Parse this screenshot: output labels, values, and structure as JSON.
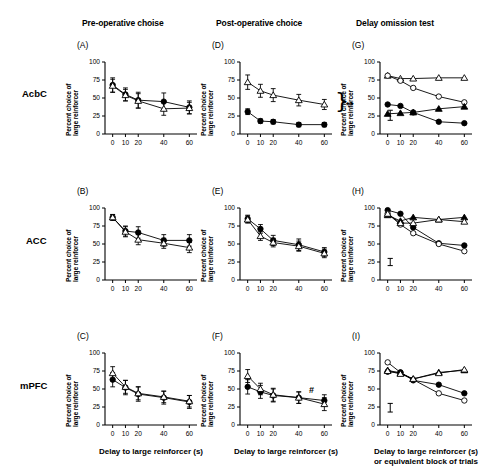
{
  "figure": {
    "column_headers": [
      {
        "id": "pre-operative",
        "label": "Pre-operative choise"
      },
      {
        "id": "post-operative",
        "label": "Post-operative choice"
      },
      {
        "id": "delay-omission",
        "label": "Delay omission test"
      }
    ],
    "row_labels": [
      {
        "id": "acbc",
        "label": "AcbC"
      },
      {
        "id": "acc",
        "label": "ACC"
      },
      {
        "id": "mpfc",
        "label": "mPFC"
      }
    ],
    "axis_titles": {
      "y": [
        "Percent choice of",
        "large reinforcer"
      ],
      "x_standard": "Delay to large reinforcer (s)",
      "x_omission": [
        "Delay to large reinforcer (s)",
        "or equivalent block of trials"
      ]
    },
    "y_ticks": [
      "0",
      "25",
      "50",
      "75",
      "100"
    ],
    "x_ticks": [
      "0",
      "10",
      "20",
      "40",
      "60"
    ],
    "significance": {
      "double_asterisk": "**",
      "hash": "#"
    },
    "colors": {
      "ink": "#000000",
      "marker_fill": "#000000",
      "marker_open": "#ffffff"
    }
  },
  "chart_data": [
    {
      "id": "A",
      "type": "line",
      "panel_letter": "(A)",
      "row": "AcbC",
      "column": "Pre-operative choise",
      "title": "",
      "xlabel": "",
      "ylabel": "Percent choice of large reinforcer",
      "x": [
        0,
        10,
        20,
        40,
        60
      ],
      "xlim": [
        -6,
        66
      ],
      "ylim": [
        0,
        100
      ],
      "grid": false,
      "legend": "none",
      "series": [
        {
          "name": "sham",
          "marker": "filled-circle",
          "values": [
            68,
            55,
            47,
            45,
            37
          ],
          "errors": [
            10,
            9,
            11,
            12,
            9
          ]
        },
        {
          "name": "lesion",
          "marker": "open-triangle",
          "values": [
            67,
            54,
            46,
            35,
            36
          ],
          "errors": [
            9,
            8,
            10,
            9,
            8
          ]
        }
      ]
    },
    {
      "id": "B",
      "type": "line",
      "panel_letter": "(B)",
      "row": "ACC",
      "column": "Pre-operative choise",
      "title": "",
      "xlabel": "",
      "ylabel": "Percent choice of large reinforcer",
      "x": [
        0,
        10,
        20,
        40,
        60
      ],
      "xlim": [
        -6,
        66
      ],
      "ylim": [
        0,
        100
      ],
      "grid": false,
      "legend": "none",
      "series": [
        {
          "name": "sham",
          "marker": "filled-circle",
          "values": [
            87,
            68,
            66,
            55,
            55
          ],
          "errors": [
            4,
            7,
            8,
            8,
            8
          ]
        },
        {
          "name": "lesion",
          "marker": "open-triangle",
          "values": [
            87,
            67,
            56,
            51,
            45
          ],
          "errors": [
            4,
            7,
            7,
            7,
            7
          ]
        }
      ]
    },
    {
      "id": "C",
      "type": "line",
      "panel_letter": "(C)",
      "row": "mPFC",
      "column": "Pre-operative choise",
      "title": "",
      "xlabel": "Delay to large reinforcer (s)",
      "ylabel": "Percent choice of large reinforcer",
      "x": [
        0,
        10,
        20,
        40,
        60
      ],
      "xlim": [
        -6,
        66
      ],
      "ylim": [
        0,
        100
      ],
      "grid": false,
      "legend": "none",
      "series": [
        {
          "name": "sham",
          "marker": "filled-circle",
          "values": [
            63,
            52,
            43,
            38,
            32
          ],
          "errors": [
            10,
            10,
            10,
            9,
            9
          ]
        },
        {
          "name": "lesion",
          "marker": "open-triangle",
          "values": [
            72,
            53,
            44,
            39,
            33
          ],
          "errors": [
            9,
            9,
            9,
            8,
            8
          ]
        }
      ]
    },
    {
      "id": "D",
      "type": "line",
      "panel_letter": "(D)",
      "row": "AcbC",
      "column": "Post-operative choice",
      "title": "",
      "xlabel": "",
      "ylabel": "Percent choice of large reinforcer",
      "x": [
        0,
        10,
        20,
        40,
        60
      ],
      "xlim": [
        -6,
        66
      ],
      "ylim": [
        0,
        100
      ],
      "grid": false,
      "legend": "none",
      "annotation": "**",
      "series": [
        {
          "name": "sham",
          "marker": "open-triangle",
          "values": [
            72,
            60,
            54,
            47,
            41
          ],
          "errors": [
            10,
            9,
            9,
            8,
            7
          ]
        },
        {
          "name": "AcbC lesion",
          "marker": "filled-circle",
          "values": [
            31,
            18,
            17,
            13,
            13
          ],
          "errors": [
            4,
            3,
            3,
            3,
            3
          ]
        }
      ]
    },
    {
      "id": "E",
      "type": "line",
      "panel_letter": "(E)",
      "row": "ACC",
      "column": "Post-operative choice",
      "title": "",
      "xlabel": "",
      "ylabel": "Percent choice of large reinforcer",
      "x": [
        0,
        10,
        20,
        40,
        60
      ],
      "xlim": [
        -6,
        66
      ],
      "ylim": [
        0,
        100
      ],
      "grid": false,
      "legend": "none",
      "series": [
        {
          "name": "sham",
          "marker": "filled-circle",
          "values": [
            85,
            71,
            55,
            49,
            39
          ],
          "errors": [
            5,
            6,
            7,
            8,
            6
          ]
        },
        {
          "name": "ACC lesion",
          "marker": "open-triangle",
          "values": [
            84,
            61,
            52,
            47,
            37
          ],
          "errors": [
            5,
            6,
            6,
            7,
            6
          ]
        }
      ]
    },
    {
      "id": "F",
      "type": "line",
      "panel_letter": "(F)",
      "row": "mPFC",
      "column": "Post-operative choice",
      "title": "",
      "xlabel": "Delay to large reinforcer (s)",
      "ylabel": "Percent choice of large reinforcer",
      "x": [
        0,
        10,
        20,
        40,
        60
      ],
      "xlim": [
        -6,
        66
      ],
      "ylim": [
        0,
        100
      ],
      "grid": false,
      "legend": "none",
      "annotation": "#",
      "series": [
        {
          "name": "sham",
          "marker": "filled-circle",
          "values": [
            53,
            46,
            41,
            38,
            34
          ],
          "errors": [
            10,
            9,
            9,
            8,
            8
          ]
        },
        {
          "name": "mPFC lesion",
          "marker": "open-triangle",
          "values": [
            68,
            50,
            42,
            38,
            29
          ],
          "errors": [
            9,
            8,
            9,
            8,
            9
          ]
        }
      ]
    },
    {
      "id": "G",
      "type": "line",
      "panel_letter": "(G)",
      "row": "AcbC",
      "column": "Delay omission test",
      "title": "",
      "xlabel": "",
      "ylabel": "Percent choice of large reinforcer",
      "x": [
        0,
        10,
        20,
        40,
        60
      ],
      "xlim": [
        -6,
        66
      ],
      "ylim": [
        0,
        100
      ],
      "grid": false,
      "legend": "none",
      "pooled_error_bar": 7,
      "series": [
        {
          "name": "sham omission",
          "marker": "open-triangle",
          "values": [
            81,
            77,
            77,
            78,
            78
          ]
        },
        {
          "name": "sham delay",
          "marker": "open-circle",
          "values": [
            81,
            74,
            64,
            52,
            44
          ]
        },
        {
          "name": "lesion delay",
          "marker": "filled-circle",
          "values": [
            41,
            39,
            30,
            17,
            15
          ]
        },
        {
          "name": "lesion omission",
          "marker": "filled-triangle",
          "values": [
            28,
            29,
            30,
            35,
            38
          ]
        }
      ]
    },
    {
      "id": "H",
      "type": "line",
      "panel_letter": "(H)",
      "row": "ACC",
      "column": "Delay omission test",
      "title": "",
      "xlabel": "",
      "ylabel": "Percent choice of large reinforcer",
      "x": [
        0,
        10,
        20,
        40,
        60
      ],
      "xlim": [
        -6,
        66
      ],
      "ylim": [
        0,
        100
      ],
      "grid": false,
      "legend": "none",
      "pooled_error_bar": 5,
      "series": [
        {
          "name": "sham delay",
          "marker": "filled-circle",
          "values": [
            97,
            92,
            73,
            51,
            48
          ]
        },
        {
          "name": "lesion delay",
          "marker": "open-circle",
          "values": [
            92,
            77,
            65,
            50,
            40
          ]
        },
        {
          "name": "sham omission",
          "marker": "filled-triangle",
          "values": [
            90,
            82,
            87,
            84,
            87
          ]
        },
        {
          "name": "lesion omission",
          "marker": "open-triangle",
          "values": [
            92,
            79,
            79,
            84,
            81
          ]
        }
      ]
    },
    {
      "id": "I",
      "type": "line",
      "panel_letter": "(I)",
      "row": "mPFC",
      "column": "Delay omission test",
      "title": "",
      "xlabel": "Delay to large reinforcer (s) or equivalent block of trials",
      "ylabel": "Percent choice of large reinforcer",
      "x": [
        0,
        10,
        20,
        40,
        60
      ],
      "xlim": [
        -6,
        66
      ],
      "ylim": [
        0,
        100
      ],
      "grid": false,
      "legend": "none",
      "pooled_error_bar": 6,
      "series": [
        {
          "name": "sham delay",
          "marker": "open-circle",
          "values": [
            87,
            73,
            63,
            44,
            34
          ]
        },
        {
          "name": "lesion delay",
          "marker": "filled-circle",
          "values": [
            74,
            73,
            62,
            56,
            44
          ]
        },
        {
          "name": "sham omission",
          "marker": "filled-triangle",
          "values": [
            76,
            72,
            64,
            73,
            76
          ]
        },
        {
          "name": "lesion omission",
          "marker": "open-triangle",
          "values": [
            75,
            71,
            64,
            72,
            77
          ]
        }
      ]
    }
  ]
}
